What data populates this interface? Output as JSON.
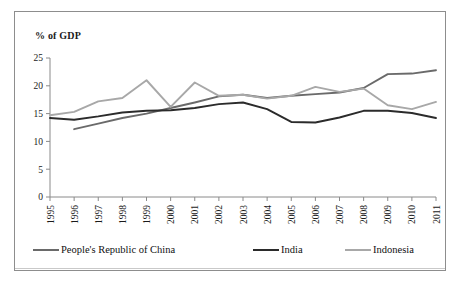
{
  "chart_data": {
    "type": "line",
    "title": "",
    "ylabel": "% of GDP",
    "xlabel": "",
    "ylim": [
      0,
      25
    ],
    "yticks": [
      0,
      5,
      10,
      15,
      20,
      25
    ],
    "ytick_labels": [
      "0",
      "5",
      "10",
      "15",
      "20",
      "25"
    ],
    "grid": false,
    "legend_position": "bottom",
    "categories": [
      "1995",
      "1996",
      "1997",
      "1998",
      "1999",
      "2000",
      "2001",
      "2002",
      "2003",
      "2004",
      "2005",
      "2006",
      "2007",
      "2008",
      "2009",
      "2010",
      "2011"
    ],
    "x": [
      1995,
      1996,
      1997,
      1998,
      1999,
      2000,
      2001,
      2002,
      2003,
      2004,
      2005,
      2006,
      2007,
      2008,
      2009,
      2010,
      2011
    ],
    "series": [
      {
        "name": "People's Republic of China",
        "color": "#6a6a6a",
        "values": [
          null,
          12.2,
          13.2,
          14.2,
          15.0,
          16.0,
          17.0,
          18.1,
          18.4,
          17.8,
          18.2,
          18.5,
          18.8,
          19.6,
          22.1,
          22.2,
          22.8
        ]
      },
      {
        "name": "India",
        "color": "#2b2b2b",
        "values": [
          14.2,
          13.9,
          14.5,
          15.2,
          15.5,
          15.6,
          16.0,
          16.7,
          17.0,
          15.8,
          13.5,
          13.4,
          14.3,
          15.5,
          15.5,
          15.1,
          14.2
        ]
      },
      {
        "name": "Indonesia",
        "color": "#a8a8a8",
        "values": [
          14.7,
          15.3,
          17.2,
          17.8,
          21.0,
          16.2,
          20.6,
          18.2,
          18.4,
          17.7,
          18.2,
          19.8,
          18.9,
          19.5,
          16.5,
          15.8,
          17.1
        ]
      }
    ]
  },
  "legend": {
    "items": [
      {
        "label": "People's Republic of China",
        "color": "#6a6a6a"
      },
      {
        "label": "India",
        "color": "#2b2b2b"
      },
      {
        "label": "Indonesia",
        "color": "#a8a8a8"
      }
    ]
  },
  "axes": {
    "y_axis_title": "% of GDP"
  }
}
